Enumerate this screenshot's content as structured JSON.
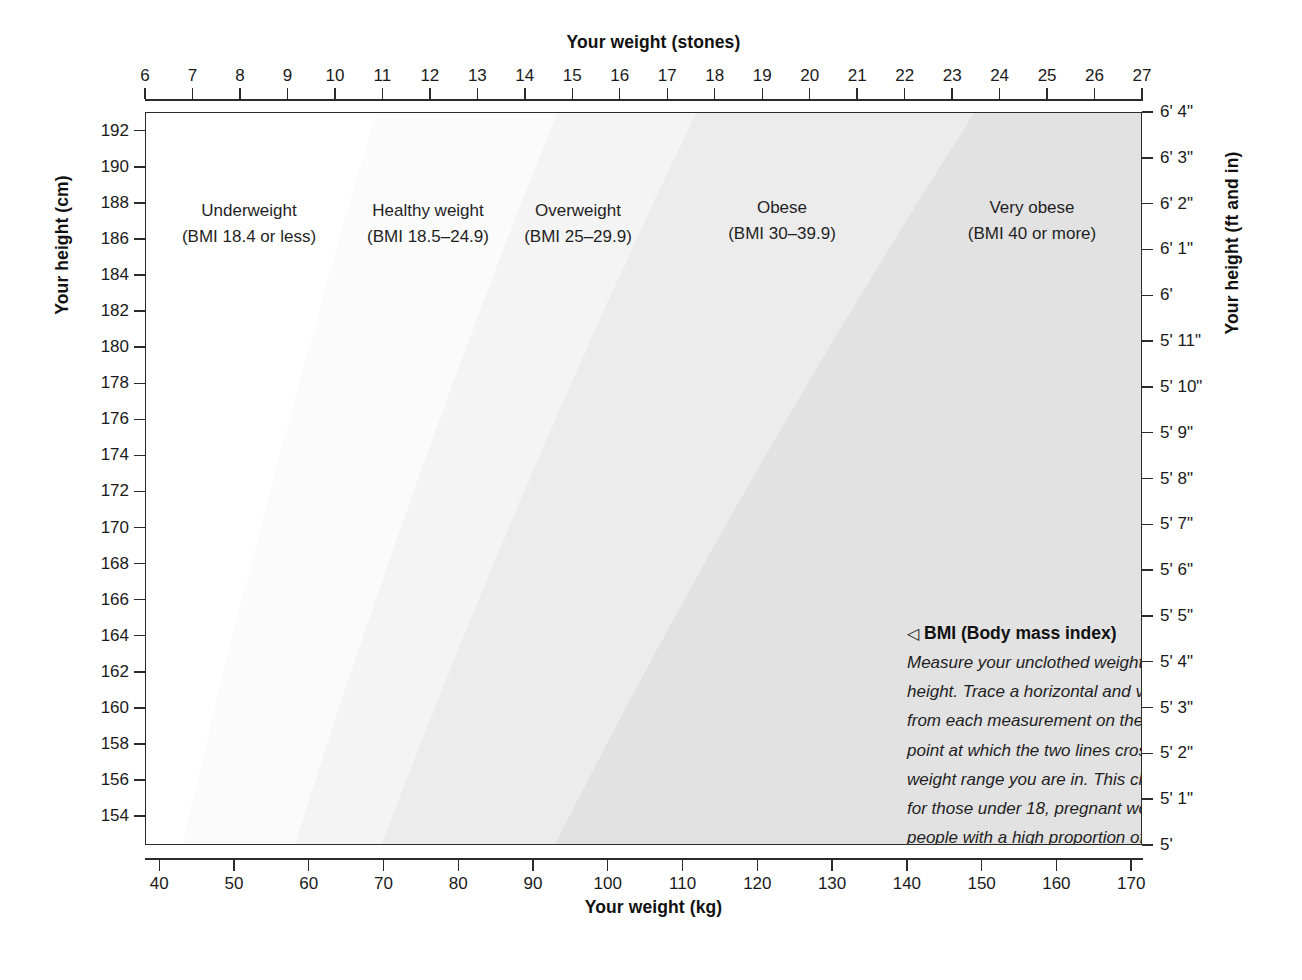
{
  "chart_data": {
    "type": "heatmap",
    "xlabel": "Your weight (kg)",
    "ylabel": "Your height (cm)",
    "x2label": "Your weight (stones)",
    "y2label": "Your height (ft and in)",
    "grid": false,
    "legend_position": "inside-top",
    "xlim": [
      38.1,
      171.45
    ],
    "ylim": [
      152.4,
      193.04
    ],
    "x_ticks_kg": [
      40,
      50,
      60,
      70,
      80,
      90,
      100,
      110,
      120,
      130,
      140,
      150,
      160,
      170
    ],
    "x_ticks_stones": [
      6,
      7,
      8,
      9,
      10,
      11,
      12,
      13,
      14,
      15,
      16,
      17,
      18,
      19,
      20,
      21,
      22,
      23,
      24,
      25,
      26,
      27
    ],
    "y_ticks_cm": [
      192,
      190,
      188,
      186,
      184,
      182,
      180,
      178,
      176,
      174,
      172,
      170,
      168,
      166,
      164,
      162,
      160,
      158,
      156,
      154
    ],
    "y_ticks_ft": [
      "6' 4\"",
      "6' 3\"",
      "6' 2\"",
      "6' 1\"",
      "6'",
      "5' 11\"",
      "5' 10\"",
      "5' 9\"",
      "5' 8\"",
      "5' 7\"",
      "5' 6\"",
      "5' 5\"",
      "5' 4\"",
      "5' 3\"",
      "5' 2\"",
      "5' 1\"",
      "5'"
    ],
    "y_values_ft_cm": [
      193.04,
      190.5,
      187.96,
      185.42,
      182.88,
      180.34,
      177.8,
      175.26,
      172.72,
      170.18,
      167.64,
      165.1,
      162.56,
      160.02,
      157.48,
      154.94,
      152.4
    ],
    "bmi_boundaries": [
      18.5,
      25,
      30,
      40
    ],
    "zones": [
      {
        "name": "Underweight",
        "range": "(BMI 18.4 or less)",
        "bmi_min": null,
        "bmi_max": 18.4,
        "fill": "#ffffff"
      },
      {
        "name": "Healthy weight",
        "range": "(BMI 18.5–24.9)",
        "bmi_min": 18.5,
        "bmi_max": 24.9,
        "fill": "#fbfbfb"
      },
      {
        "name": "Overweight",
        "range": "(BMI 25–29.9)",
        "bmi_min": 25,
        "bmi_max": 29.9,
        "fill": "#f4f4f4"
      },
      {
        "name": "Obese",
        "range": "(BMI 30–39.9)",
        "bmi_min": 30,
        "bmi_max": 39.9,
        "fill": "#ececec"
      },
      {
        "name": "Very obese",
        "range": "(BMI 40 or more)",
        "bmi_min": 40,
        "bmi_max": null,
        "fill": "#e2e2e2"
      }
    ]
  },
  "axes": {
    "top": {
      "title": "Your weight (stones)",
      "labels": [
        "6",
        "7",
        "8",
        "9",
        "10",
        "11",
        "12",
        "13",
        "14",
        "15",
        "16",
        "17",
        "18",
        "19",
        "20",
        "21",
        "22",
        "23",
        "24",
        "25",
        "26",
        "27"
      ]
    },
    "bottom": {
      "title": "Your weight (kg)",
      "labels": [
        "40",
        "50",
        "60",
        "70",
        "80",
        "90",
        "100",
        "110",
        "120",
        "130",
        "140",
        "150",
        "160",
        "170"
      ]
    },
    "left": {
      "title": "Your height (cm)",
      "labels": [
        "192",
        "190",
        "188",
        "186",
        "184",
        "182",
        "180",
        "178",
        "176",
        "174",
        "172",
        "170",
        "168",
        "166",
        "164",
        "162",
        "160",
        "158",
        "156",
        "154"
      ]
    },
    "right": {
      "title": "Your height (ft and in)",
      "labels": [
        "6' 4\"",
        "6' 3\"",
        "6' 2\"",
        "6' 1\"",
        "6'",
        "5' 11\"",
        "5' 10\"",
        "5' 9\"",
        "5' 8\"",
        "5' 7\"",
        "5' 6\"",
        "5' 5\"",
        "5' 4\"",
        "5' 3\"",
        "5' 2\"",
        "5' 1\"",
        "5'"
      ]
    }
  },
  "zone_labels": [
    {
      "name": "Underweight",
      "range": "(BMI 18.4 or less)"
    },
    {
      "name": "Healthy weight",
      "range": "(BMI 18.5–24.9)"
    },
    {
      "name": "Overweight",
      "range": "(BMI 25–29.9)"
    },
    {
      "name": "Obese",
      "range": "(BMI 30–39.9)"
    },
    {
      "name": "Very obese",
      "range": "(BMI 40 or more)"
    }
  ],
  "annotation": {
    "marker": "◁",
    "heading": "BMI (Body mass index)",
    "body": "Measure your unclothed weight and your height. Trace a horizontal and vertical line from each measurement on the chart. The point at which the two lines cross indicates the weight range you are in. This chart is not valid for those under 18, pregnant women, or people with a high proportion of body muscle."
  },
  "colors": {
    "axis": "#2b2b2b",
    "text": "#1a1a1a",
    "background": "#ffffff",
    "band_healthy": "#fbfbfb",
    "band_overweight": "#f4f4f4",
    "band_obese": "#ececec",
    "band_very_obese": "#e2e2e2"
  }
}
